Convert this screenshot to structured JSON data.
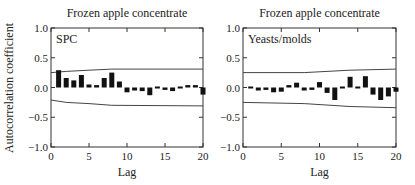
{
  "ylabel": "Autocorrelation coefficient",
  "chart_data": [
    {
      "type": "bar",
      "title": "Frozen apple concentrate",
      "annotation": "SPC",
      "xlabel": "Lag",
      "ylabel": "Autocorrelation coefficient",
      "xlim": [
        0,
        20
      ],
      "ylim": [
        -1.0,
        1.0
      ],
      "xticks": [
        0,
        5,
        10,
        15,
        20
      ],
      "yticks": [
        -1.0,
        -0.5,
        0.0,
        0.5,
        1.0
      ],
      "ytick_labels": [
        "−1.0",
        "−0.5",
        "0.0",
        "0.5",
        "1.0"
      ],
      "lags": [
        1,
        2,
        3,
        4,
        5,
        6,
        7,
        8,
        9,
        10,
        11,
        12,
        13,
        14,
        15,
        16,
        17,
        18,
        19,
        20
      ],
      "values": [
        0.29,
        0.16,
        0.12,
        0.21,
        0.05,
        0.04,
        0.16,
        0.25,
        0.1,
        -0.08,
        -0.05,
        -0.06,
        -0.13,
        -0.02,
        -0.04,
        -0.06,
        -0.01,
        0.04,
        0.04,
        -0.12
      ],
      "confidence_upper": [
        [
          0,
          0.25
        ],
        [
          2,
          0.27
        ],
        [
          5,
          0.29
        ],
        [
          8,
          0.31
        ],
        [
          20,
          0.31
        ]
      ],
      "confidence_lower": [
        [
          0,
          -0.21
        ],
        [
          2,
          -0.25
        ],
        [
          5,
          -0.27
        ],
        [
          8,
          -0.3
        ],
        [
          20,
          -0.31
        ]
      ]
    },
    {
      "type": "bar",
      "title": "Frozen apple concentrate",
      "annotation": "Yeasts/molds",
      "xlabel": "Lag",
      "ylabel": "",
      "xlim": [
        0,
        20
      ],
      "ylim": [
        -1.0,
        1.0
      ],
      "xticks": [
        0,
        5,
        10,
        15,
        20
      ],
      "yticks": [
        -1.0,
        -0.5,
        0.0,
        0.5,
        1.0
      ],
      "ytick_labels": [
        "−1.0",
        "−0.5",
        "0.0",
        "0.5",
        "1.0"
      ],
      "lags": [
        1,
        2,
        3,
        4,
        5,
        6,
        7,
        8,
        9,
        10,
        11,
        12,
        13,
        14,
        15,
        16,
        17,
        18,
        19,
        20
      ],
      "values": [
        -0.02,
        -0.05,
        -0.04,
        -0.08,
        -0.07,
        0.04,
        0.08,
        -0.05,
        -0.04,
        0.09,
        -0.09,
        -0.21,
        -0.02,
        0.18,
        -0.01,
        0.19,
        -0.12,
        -0.21,
        -0.15,
        -0.07
      ],
      "confidence_upper": [
        [
          0,
          0.25
        ],
        [
          8,
          0.25
        ],
        [
          14,
          0.29
        ],
        [
          20,
          0.31
        ]
      ],
      "confidence_lower": [
        [
          0,
          -0.25
        ],
        [
          8,
          -0.27
        ],
        [
          14,
          -0.32
        ],
        [
          20,
          -0.34
        ]
      ]
    }
  ]
}
